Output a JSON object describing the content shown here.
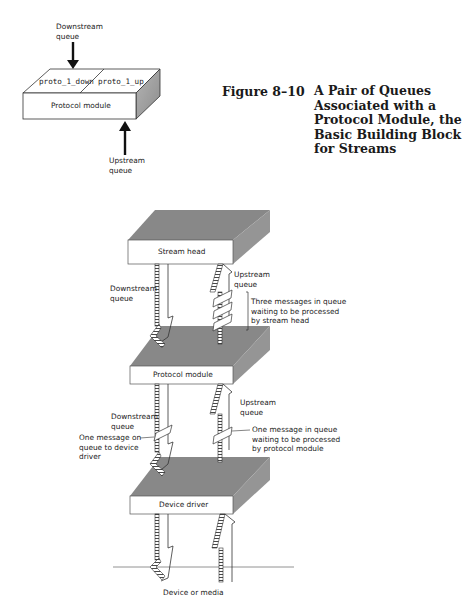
{
  "caption": {
    "number": "Figure 8–10",
    "title_lines": [
      "A Pair of Queues",
      "Associated with a",
      "Protocol Module, the",
      "Basic Building Block",
      "for Streams"
    ]
  },
  "top_diagram": {
    "downstream_label": "Downstream\nqueue",
    "upstream_label": "Upstream\nqueue",
    "queue_left": "proto_1_down",
    "queue_right": "proto_1_up",
    "module_label": "Protocol module"
  },
  "stream_diagram": {
    "layers": [
      {
        "label": "Stream head"
      },
      {
        "label": "Protocol module"
      },
      {
        "label": "Device driver"
      }
    ],
    "annotations": {
      "head_downstream": "Downstream\nqueue",
      "head_upstream": "Upstream\nqueue",
      "head_messages": "Three messages in queue\nwaiting to be processed\nby stream head",
      "proto_downstream": "Downstream\nqueue",
      "proto_upstream": "Upstream\nqueue",
      "proto_message_up": "One message in queue\nwaiting to be processed\nby protocol module",
      "proto_message_down": "One message on\nqueue to device\ndriver"
    },
    "bottom_label": "Device or media"
  },
  "colors": {
    "slab_top": "#8a8a8a",
    "slab_side": "#9a9a9a",
    "slab_front": "#ffffff",
    "ink": "#1a1a1a"
  }
}
